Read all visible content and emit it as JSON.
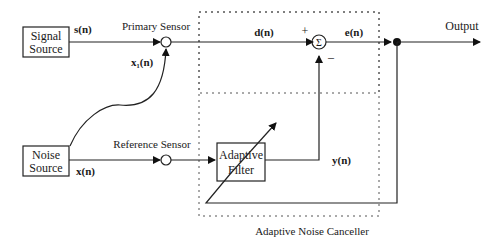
{
  "blocks": {
    "signal_source": [
      "Signal",
      "Source"
    ],
    "noise_source": [
      "Noise",
      "Source"
    ],
    "adaptive_filter": [
      "Adaptive",
      "Filter"
    ]
  },
  "labels": {
    "primary_sensor": "Primary Sensor",
    "reference_sensor": "Reference Sensor",
    "output": "Output",
    "canceller": "Adaptive Noise Canceller",
    "plus": "+",
    "minus": "–",
    "sigma": "Σ"
  },
  "signals": {
    "s": "s(n)",
    "x1": "x₁(n)",
    "x": "x(n)",
    "d": "d(n)",
    "e": "e(n)",
    "y": "y(n)"
  }
}
